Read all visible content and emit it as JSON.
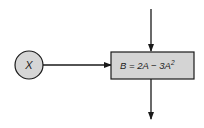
{
  "diagram": {
    "input_node": {
      "label": "X",
      "shape": "circle",
      "fill": "#d6d6d6"
    },
    "process_box": {
      "equation_prefix": "B = 2A − 3A",
      "exponent": "2",
      "fill": "#d4d4d4"
    },
    "arrows": [
      {
        "from": "top",
        "to": "process_box"
      },
      {
        "from": "input_node",
        "to": "process_box"
      },
      {
        "from": "process_box",
        "to": "bottom"
      }
    ],
    "colors": {
      "stroke": "#1a1a1a",
      "background": "#ffffff"
    }
  }
}
